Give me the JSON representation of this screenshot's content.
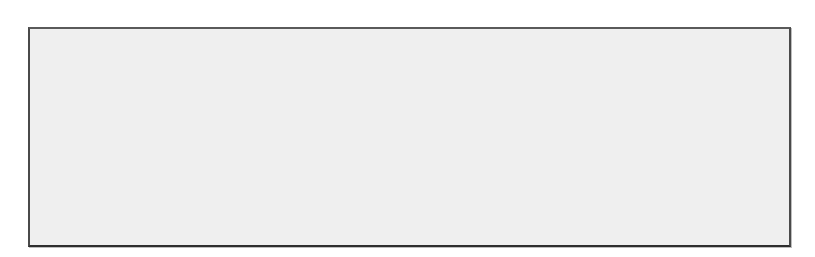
{
  "subtitle": "Blue lines show optimal settings. Black lines show the predicted Y at different settings.",
  "y_axis": {
    "ticks": [
      60,
      80,
      100
    ],
    "ylim": [
      59,
      121
    ]
  },
  "colors": {
    "frame": "#4a4a4a",
    "background": "#efefef",
    "plot_bg": "#ffffff",
    "line": "#3a3a3a",
    "optimal": "#777777"
  },
  "chart_data": [
    {
      "type": "line",
      "title": "pH",
      "xlabel": "pH",
      "ylabel": "Predicted Y",
      "x_ticks": [
        2.0,
        4.5,
        7.0
      ],
      "x_tick_labels": [
        "2.0",
        "4.5",
        "7.0"
      ],
      "xlim": [
        1.8,
        8.6
      ],
      "ylim": [
        59,
        121
      ],
      "optimal_x": 8.3,
      "x": [
        2.0,
        3.0,
        4.0,
        5.0,
        6.0,
        7.0,
        8.3
      ],
      "y": [
        110,
        110.6,
        111.6,
        112.3,
        113,
        113.8,
        115.5
      ]
    },
    {
      "type": "line",
      "title": "Sugars",
      "xlabel": "Sugars",
      "ylabel": "Predicted Y",
      "x_ticks": [
        0,
        50,
        100
      ],
      "x_tick_labels": [
        "0",
        "50",
        "100"
      ],
      "xlim": [
        -2,
        104
      ],
      "ylim": [
        59,
        121
      ],
      "optimal_x": 100,
      "x": [
        5,
        25,
        50,
        75,
        100
      ],
      "y": [
        62,
        73,
        86,
        101,
        116
      ]
    },
    {
      "type": "line",
      "title": "Temperature",
      "xlabel": "Temperature",
      "ylabel": "Predicted Y",
      "x_ticks": [
        8,
        16,
        24
      ],
      "x_tick_labels": [
        "8",
        "16",
        "24"
      ],
      "xlim": [
        5,
        26.5
      ],
      "ylim": [
        59,
        121
      ],
      "optimal_x": 25,
      "x": [
        6,
        10,
        15,
        20,
        25
      ],
      "y": [
        81,
        88,
        97,
        106,
        116
      ]
    }
  ]
}
